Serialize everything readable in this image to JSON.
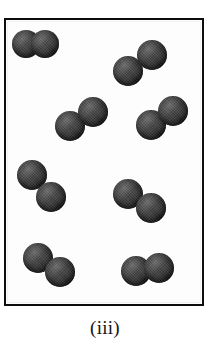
{
  "figure": {
    "caption": "(iii)",
    "kind": "particulate-diagram",
    "frame": {
      "border_color": "#0d0d0d",
      "border_width_px": 2,
      "background_color": "#fdfdfd",
      "x": 4,
      "y": 18,
      "width": 200,
      "height": 288
    },
    "atom_style": {
      "fill_color": "#2a2a2a",
      "highlight_color": "#6e6e6e",
      "shadow_color": "#141414",
      "diameter_px": 28
    },
    "molecule_count": 8,
    "atoms_per_molecule": 2,
    "total_atoms": 16,
    "molecules": [
      {
        "id": "molecule-1",
        "label": "diatomic-molecule-top-left",
        "atoms": [
          {
            "cx": 20,
            "cy": 24,
            "r": 14
          },
          {
            "cx": 39,
            "cy": 24,
            "r": 14
          }
        ]
      },
      {
        "id": "molecule-2",
        "label": "diatomic-molecule-top-right",
        "atoms": [
          {
            "cx": 122,
            "cy": 51,
            "r": 15
          },
          {
            "cx": 146,
            "cy": 35,
            "r": 15
          }
        ]
      },
      {
        "id": "molecule-3",
        "label": "diatomic-molecule-middle-left",
        "atoms": [
          {
            "cx": 64,
            "cy": 106,
            "r": 15
          },
          {
            "cx": 87,
            "cy": 92,
            "r": 15
          }
        ]
      },
      {
        "id": "molecule-4",
        "label": "diatomic-molecule-middle-right",
        "atoms": [
          {
            "cx": 145,
            "cy": 105,
            "r": 15
          },
          {
            "cx": 167,
            "cy": 91,
            "r": 15
          }
        ]
      },
      {
        "id": "molecule-5",
        "label": "diatomic-molecule-lower-middle-left",
        "atoms": [
          {
            "cx": 26,
            "cy": 155,
            "r": 15
          },
          {
            "cx": 45,
            "cy": 177,
            "r": 15
          }
        ]
      },
      {
        "id": "molecule-6",
        "label": "diatomic-molecule-lower-middle-right",
        "atoms": [
          {
            "cx": 122,
            "cy": 174,
            "r": 15
          },
          {
            "cx": 145,
            "cy": 188,
            "r": 15
          }
        ]
      },
      {
        "id": "molecule-7",
        "label": "diatomic-molecule-bottom-left",
        "atoms": [
          {
            "cx": 32,
            "cy": 238,
            "r": 15
          },
          {
            "cx": 54,
            "cy": 252,
            "r": 15
          }
        ]
      },
      {
        "id": "molecule-8",
        "label": "diatomic-molecule-bottom-right",
        "atoms": [
          {
            "cx": 130,
            "cy": 251,
            "r": 15
          },
          {
            "cx": 153,
            "cy": 248,
            "r": 15
          }
        ]
      }
    ]
  }
}
